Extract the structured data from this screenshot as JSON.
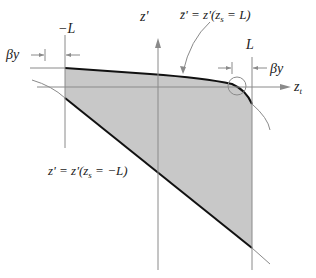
{
  "diagram": {
    "labels": {
      "minus_L": "−L",
      "L": "L",
      "beta_y_left": "βy",
      "beta_y_right": "βy",
      "z_prime_axis": "z'",
      "z_t_axis_base": "z",
      "z_t_axis_sub": "t",
      "upper_curve_label": "z̄' = z'(z",
      "upper_curve_label_sub": "s",
      "upper_curve_label_tail": " = L)",
      "lower_curve_label": "z' = z'(z",
      "lower_curve_label_sub": "s",
      "lower_curve_label_tail": " = −L)"
    },
    "colors": {
      "shade": "#c8c8c8",
      "thick_line": "#111111",
      "thin_line": "#8a8a8a"
    }
  }
}
